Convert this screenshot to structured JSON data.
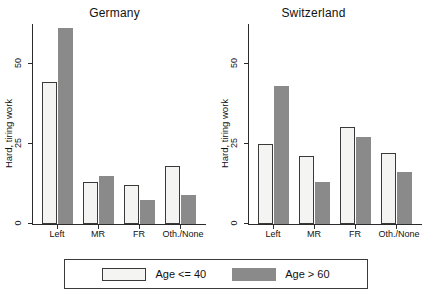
{
  "chart_data": {
    "type": "bar",
    "title": "",
    "panels": [
      {
        "title": "Germany",
        "categories": [
          "Left",
          "MR",
          "FR",
          "Oth./None"
        ],
        "series": [
          {
            "name": "Age <= 40",
            "values": [
              44,
              13,
              12,
              18
            ]
          },
          {
            "name": "Age > 60",
            "values": [
              61,
              15,
              7.5,
              9
            ]
          }
        ]
      },
      {
        "title": "Switzerland",
        "categories": [
          "Left",
          "MR",
          "FR",
          "Oth./None"
        ],
        "series": [
          {
            "name": "Age <= 40",
            "values": [
              25,
              21,
              30,
              22
            ]
          },
          {
            "name": "Age > 60",
            "values": [
              43,
              13,
              27,
              16
            ]
          }
        ]
      }
    ],
    "ylabel": "Hard, tiring work",
    "xlabel": "",
    "yticks": [
      0,
      25,
      50
    ],
    "ytick_labels": [
      "0",
      "25",
      "50"
    ],
    "ylim": [
      0,
      61.5
    ],
    "grid": false,
    "legend": {
      "position": "bottom",
      "entries": [
        {
          "label": "Age <= 40",
          "color": "#f4f4f2",
          "style": "outlined"
        },
        {
          "label": "Age > 60",
          "color": "#8a8a8a",
          "style": "filled"
        }
      ]
    },
    "colors": {
      "light_bar": "#f4f4f2",
      "dark_bar": "#8a8a8a",
      "axis": "#2b2b2b",
      "text": "#111111",
      "background": "#ffffff"
    }
  }
}
